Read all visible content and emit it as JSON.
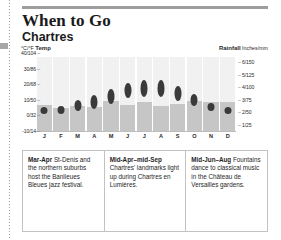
{
  "header": {
    "title": "When to Go",
    "subtitle": "Chartres"
  },
  "axes": {
    "temp_caption_unit": "°C/°F ",
    "temp_caption_label": "Temp",
    "rain_caption_label": "Rainfall",
    "rain_caption_unit": " Inches/mm",
    "temp_ticks": [
      "40/104",
      "30/86",
      "20/68",
      "10/50",
      "0/32",
      "-10/14"
    ],
    "rain_ticks": [
      "6/150",
      "5/125",
      "4/100",
      "3/75",
      "2/50",
      "1/25"
    ],
    "dash": "–"
  },
  "chart_data": {
    "type": "line",
    "xlabel": "",
    "ylabel": "°C/°F Temp",
    "y2label": "Rainfall Inches/mm",
    "grid": false,
    "legend": "none",
    "categories": [
      "J",
      "F",
      "M",
      "A",
      "M",
      "J",
      "J",
      "A",
      "S",
      "O",
      "N",
      "D"
    ],
    "month_names": [
      "January",
      "February",
      "March",
      "April",
      "May",
      "June",
      "July",
      "August",
      "September",
      "October",
      "November",
      "December"
    ],
    "ylim_c": [
      -10,
      40
    ],
    "y2lim_mm": [
      0,
      150
    ],
    "series": [
      {
        "name": "Temperature range (°C)",
        "type": "range-marker",
        "low": [
          1,
          1,
          3,
          4,
          7,
          11,
          12,
          12,
          9,
          6,
          3,
          1
        ],
        "high": [
          5,
          6,
          10,
          13,
          17,
          21,
          23,
          23,
          19,
          14,
          8,
          5
        ]
      },
      {
        "name": "Rainfall (mm)",
        "type": "bar",
        "values": [
          50,
          45,
          48,
          46,
          58,
          50,
          55,
          48,
          52,
          58,
          55,
          55
        ]
      }
    ]
  },
  "events": [
    {
      "period": "Mar-Apr",
      "text": " St-Denis and the northern suburbs host the Banlieues Bleues jazz festival."
    },
    {
      "period": "Mid-Apr–mid-Sep",
      "text": " Chartres' landmarks light up during Chartres en Lumières."
    },
    {
      "period": "Mid-Jun–Aug",
      "text": " Fountains dance to classical music in the Château de Versailles gardens."
    }
  ],
  "colors": {
    "rule": "#9e9e9e",
    "column_bg": "#f1f1f1",
    "rain_bar": "#c6c6c6",
    "temp_marker": "#3a3a3a",
    "box_border": "#c2c2c2"
  }
}
